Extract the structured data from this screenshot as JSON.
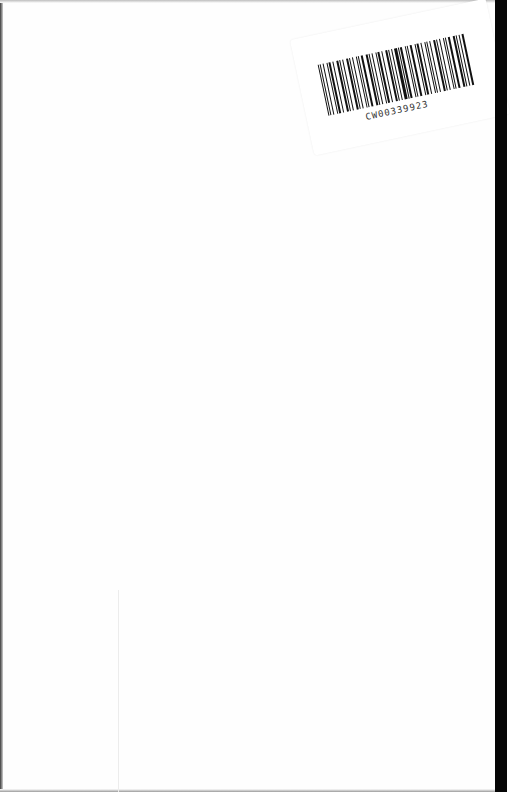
{
  "document": {
    "type": "scanned-blank-page",
    "barcode_label": {
      "code": "CW00339923"
    },
    "colors": {
      "page": "#fefefe",
      "edge_strip": "#050505",
      "barcode_ink": "#111111"
    }
  }
}
